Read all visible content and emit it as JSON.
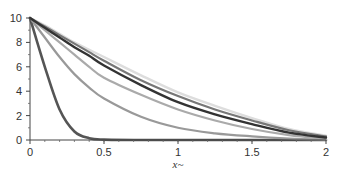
{
  "chart_data": {
    "type": "line",
    "title": "",
    "xlabel": "x~",
    "ylabel": "",
    "xlim": [
      0,
      2
    ],
    "ylim": [
      0,
      10
    ],
    "grid": false,
    "legend": null,
    "x_ticks": [
      0,
      0.5,
      1,
      1.5,
      2
    ],
    "x_tick_labels": [
      "0",
      "0.5",
      "1",
      "1.5",
      "2"
    ],
    "y_ticks": [
      0,
      2,
      4,
      6,
      8,
      10
    ],
    "y_tick_labels": [
      "0",
      "2",
      "4",
      "6",
      "8",
      "10"
    ],
    "x": [
      0,
      0.1,
      0.2,
      0.3,
      0.4,
      0.5,
      0.75,
      1.0,
      1.25,
      1.5,
      1.75,
      2.0
    ],
    "series": [
      {
        "name": "curve-1",
        "color": "#555555",
        "width": 2.6,
        "values": [
          10,
          6.0,
          2.5,
          0.7,
          0.15,
          0.03,
          0,
          0,
          0,
          0,
          0,
          0
        ]
      },
      {
        "name": "curve-2",
        "color": "#999999",
        "width": 2.2,
        "values": [
          10,
          8.4,
          6.8,
          5.4,
          4.3,
          3.4,
          1.9,
          1.0,
          0.55,
          0.3,
          0.12,
          0.0
        ]
      },
      {
        "name": "curve-3",
        "color": "#aaaaaa",
        "width": 2.2,
        "values": [
          10,
          9.0,
          8.0,
          7.0,
          6.0,
          5.1,
          3.7,
          2.5,
          1.6,
          0.9,
          0.4,
          0.1
        ]
      },
      {
        "name": "curve-4",
        "color": "#dddddd",
        "width": 2.4,
        "values": [
          10,
          9.4,
          8.7,
          8.0,
          7.4,
          6.8,
          5.3,
          3.9,
          2.8,
          1.8,
          0.9,
          0.35
        ]
      },
      {
        "name": "curve-5",
        "color": "#777777",
        "width": 2.2,
        "values": [
          10,
          9.3,
          8.6,
          7.9,
          7.2,
          6.5,
          4.9,
          3.6,
          2.5,
          1.6,
          0.8,
          0.3
        ]
      },
      {
        "name": "curve-6",
        "color": "#333333",
        "width": 2.4,
        "values": [
          10,
          9.2,
          8.4,
          7.6,
          6.9,
          6.1,
          4.5,
          3.1,
          2.1,
          1.3,
          0.6,
          0.2
        ]
      }
    ]
  }
}
